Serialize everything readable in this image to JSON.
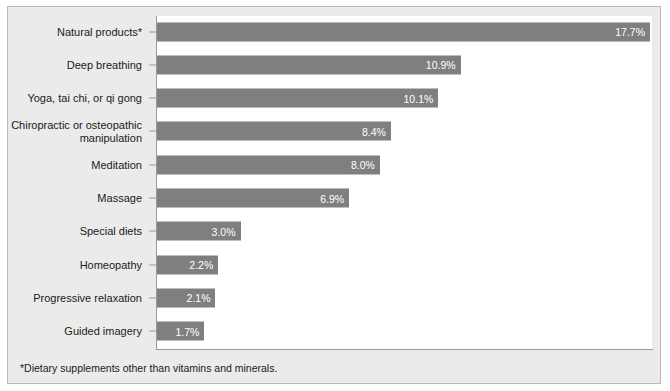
{
  "chart_data": {
    "type": "bar",
    "orientation": "horizontal",
    "title": "",
    "xlabel": "",
    "ylabel": "",
    "xlim": [
      0,
      17.7
    ],
    "grid": false,
    "legend": null,
    "categories": [
      "Natural products*",
      "Deep breathing",
      "Yoga, tai chi, or qi gong",
      "Chiropractic or osteopathic\nmanipulation",
      "Meditation",
      "Massage",
      "Special diets",
      "Homeopathy",
      "Progressive relaxation",
      "Guided imagery"
    ],
    "values": [
      17.7,
      10.9,
      10.1,
      8.4,
      8.0,
      6.9,
      3.0,
      2.2,
      2.1,
      1.7
    ],
    "value_labels": [
      "17.7%",
      "10.9%",
      "10.1%",
      "8.4%",
      "8.0%",
      "6.9%",
      "3.0%",
      "2.2%",
      "2.1%",
      "1.7%"
    ],
    "bar_color": "#7f7f7f",
    "value_label_color": "#ffffff",
    "panel_color": "#ebebeb",
    "plot_color": "#ffffff",
    "axis_color": "#9a9a9a"
  },
  "footnote": "*Dietary supplements other than vitamins and minerals."
}
